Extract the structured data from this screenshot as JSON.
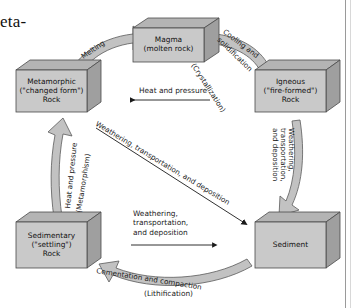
{
  "page": {
    "fragment_top": "",
    "fragment_main": "eta-"
  },
  "figure": {
    "colors": {
      "box_face": "#c9c9c9",
      "box_top": "#b4b4b4",
      "box_side": "#a0a0a0",
      "box_outline": "#4a4a4a",
      "arrow_fill": "#c2c2c2",
      "arrow_outline": "#555555",
      "text": "#1a1a1a",
      "background": "#ffffff"
    },
    "boxes": [
      {
        "id": "magma",
        "name": "magma-box",
        "lines": [
          "Magma",
          "(molten rock)"
        ]
      },
      {
        "id": "metamorphic",
        "name": "metamorphic-rock-box",
        "lines": [
          "Metamorphic",
          "(\"changed form\")",
          "Rock"
        ]
      },
      {
        "id": "igneous",
        "name": "igneous-rock-box",
        "lines": [
          "Igneous",
          "(\"fire-formed\")",
          "Rock"
        ]
      },
      {
        "id": "sedimentary",
        "name": "sedimentary-rock-box",
        "lines": [
          "Sedimentary",
          "(\"settling\")",
          "Rock"
        ]
      },
      {
        "id": "sediment",
        "name": "sediment-box",
        "lines": [
          "Sediment"
        ]
      }
    ],
    "labels": {
      "melting": "Melting",
      "cooling_1": "Cooling and",
      "cooling_2": "solidification",
      "crystallization": "(Crystallization)",
      "heat_pressure_top": "Heat and pressure",
      "weathering_right_1": "Weathering,",
      "weathering_right_2": "transportation,",
      "weathering_right_3": "and deposition",
      "heat_pressure_left": "Heat and pressure",
      "metamorphism": "(Metamorphism)",
      "diagonal_weathering": "Weathering, transportation, and deposition",
      "center_weathering_1": "Weathering,",
      "center_weathering_2": "transportation,",
      "center_weathering_3": "and deposition",
      "cementation": "Cementation and compaction",
      "lithification": "(Lithification)"
    }
  }
}
